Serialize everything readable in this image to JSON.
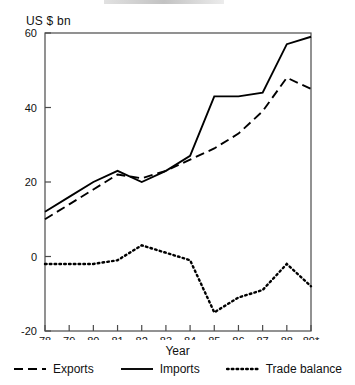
{
  "chart_data": {
    "type": "line",
    "title": "",
    "xlabel": "Year",
    "ylabel": "US $ bn",
    "x": [
      "78",
      "79",
      "80",
      "81",
      "82",
      "83",
      "84",
      "85",
      "86",
      "87",
      "88",
      "89*"
    ],
    "xtick_labels": [
      "78",
      "79",
      "80",
      "81",
      "82",
      "83",
      "84",
      "85",
      "86",
      "87",
      "88",
      "89*"
    ],
    "ytick_labels": [
      "60",
      "40",
      "20",
      "0",
      "-20"
    ],
    "ytick_values": [
      60,
      40,
      20,
      0,
      -20
    ],
    "ylim": [
      -20,
      60
    ],
    "grid": false,
    "legend_position": "bottom",
    "series": [
      {
        "name": "Exports",
        "style": "dashed",
        "values": [
          10,
          14,
          18,
          22,
          21,
          23,
          26,
          29,
          33,
          39,
          48,
          45
        ]
      },
      {
        "name": "Imports",
        "style": "solid",
        "values": [
          12,
          16,
          20,
          23,
          20,
          23,
          27,
          43,
          43,
          44,
          57,
          59
        ]
      },
      {
        "name": "Trade balance",
        "style": "dotted",
        "values": [
          -2,
          -2,
          -2,
          -1,
          3,
          1,
          -1,
          -15,
          -11,
          -9,
          -2,
          -8
        ]
      }
    ]
  },
  "axis": {
    "unit_label": "US $ bn",
    "x_title": "Year"
  },
  "legend": {
    "items": [
      {
        "label": "Exports",
        "style": "dashed"
      },
      {
        "label": "Imports",
        "style": "solid"
      },
      {
        "label": "Trade balance",
        "style": "dotted"
      }
    ]
  }
}
